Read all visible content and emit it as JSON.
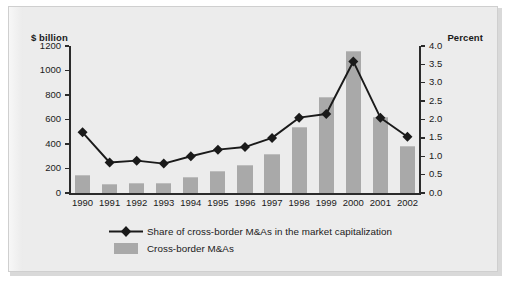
{
  "figure": {
    "background_color": "#ececec",
    "border_color": "#cfcfcf"
  },
  "chart_data": {
    "type": "bar",
    "title": "",
    "subtitle": "",
    "xlabel": "",
    "ylabel": "$ billion",
    "y2label": "Percent",
    "grid": false,
    "legend_position": "bottom",
    "categories": [
      "1990",
      "1991",
      "1992",
      "1993",
      "1994",
      "1995",
      "1996",
      "1997",
      "1998",
      "1999",
      "2000",
      "2001",
      "2002"
    ],
    "ylim": [
      0,
      1200
    ],
    "y2lim": [
      0,
      4.0
    ],
    "yticks": [
      0,
      200,
      400,
      600,
      800,
      1000,
      1200
    ],
    "ytick_labels": [
      "0",
      "200",
      "400",
      "600",
      "800",
      "1000",
      "1200"
    ],
    "y2ticks": [
      0,
      0.5,
      1.0,
      1.5,
      2.0,
      2.5,
      3.0,
      3.5,
      4.0
    ],
    "y2tick_labels": [
      "0.0",
      "0.5",
      "1.0",
      "1.5",
      "2.0",
      "2.5",
      "3.0",
      "3.5",
      "4.0"
    ],
    "series": [
      {
        "name": "Cross-border M&As",
        "type": "bar",
        "axis": "left",
        "unit": "$ billion",
        "color": "#a9a9a9",
        "values": [
          150,
          75,
          80,
          85,
          130,
          180,
          225,
          320,
          535,
          780,
          1160,
          620,
          380
        ]
      },
      {
        "name": "Share of cross-border M&As in the market capitalization",
        "type": "line",
        "axis": "right",
        "unit": "percent",
        "color": "#1a1a1a",
        "marker": "diamond",
        "values": [
          1.65,
          0.83,
          0.88,
          0.8,
          1.0,
          1.18,
          1.25,
          1.5,
          2.05,
          2.15,
          3.58,
          2.05,
          1.53
        ]
      }
    ]
  },
  "legend": {
    "items": [
      {
        "label": "Share of cross-border M&As in the market capitalization",
        "marker": "line-diamond-marker",
        "color": "#1a1a1a"
      },
      {
        "label": "Cross-border M&As",
        "marker": "square-swatch",
        "color": "#a9a9a9"
      }
    ]
  }
}
